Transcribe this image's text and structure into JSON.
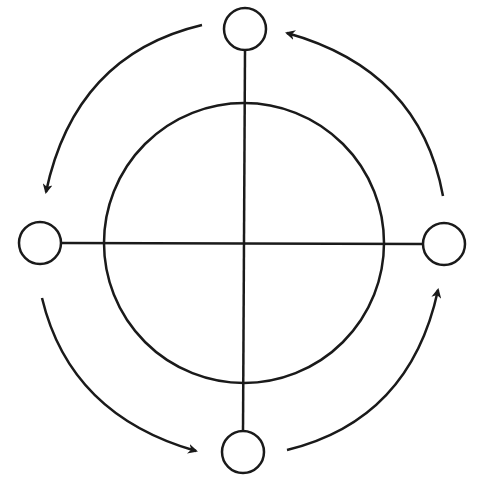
{
  "diagram": {
    "type": "cycle",
    "stroke_color": "#1a1a1a",
    "background": "#ffffff",
    "central_circle": {
      "cx": 244,
      "cy": 243,
      "r": 140
    },
    "axes": {
      "vertical": {
        "x1": 245,
        "y1": 50,
        "x2": 243,
        "y2": 431
      },
      "horizontal": {
        "x1": 61,
        "y1": 243,
        "x2": 423,
        "y2": 244
      }
    },
    "nodes": [
      {
        "id": "top",
        "cx": 245,
        "cy": 29,
        "r": 21
      },
      {
        "id": "left",
        "cx": 40,
        "cy": 243,
        "r": 21
      },
      {
        "id": "bottom",
        "cx": 243,
        "cy": 452,
        "r": 21
      },
      {
        "id": "right",
        "cx": 444,
        "cy": 244,
        "r": 21
      }
    ],
    "arrows": [
      {
        "id": "top-to-left",
        "direction": "counterclockwise",
        "path": "M202,25 Q75,55 46,192"
      },
      {
        "id": "left-to-bottom",
        "direction": "counterclockwise",
        "path": "M42,298 Q70,415 196,451"
      },
      {
        "id": "bottom-to-right",
        "direction": "counterclockwise",
        "path": "M287,450 Q410,420 438,290"
      },
      {
        "id": "right-to-top",
        "direction": "counterclockwise",
        "path": "M443,196 Q420,70 287,33"
      }
    ]
  }
}
